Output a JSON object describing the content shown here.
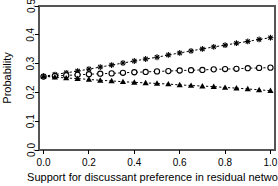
{
  "chart_data": {
    "type": "scatter",
    "title": "",
    "xlabel": "Support for discussant preference in residual network",
    "ylabel": "Probability",
    "xlim": [
      -0.02,
      1.02
    ],
    "ylim": [
      0.0,
      0.5
    ],
    "grid": false,
    "legend": "none",
    "xticks": [
      "0.0",
      "0.2",
      "0.4",
      "0.6",
      "0.8",
      "1.0"
    ],
    "xtick_values": [
      0.0,
      0.2,
      0.4,
      0.6,
      0.8,
      1.0
    ],
    "yticks": [
      "0.0",
      "0.1",
      "0.2",
      "0.3",
      "0.4",
      "0.5"
    ],
    "ytick_values": [
      0.0,
      0.1,
      0.2,
      0.3,
      0.4,
      0.5
    ],
    "x": [
      0.0,
      0.05,
      0.1,
      0.15,
      0.2,
      0.25,
      0.3,
      0.35,
      0.4,
      0.45,
      0.5,
      0.55,
      0.6,
      0.65,
      0.7,
      0.75,
      0.8,
      0.85,
      0.9,
      0.95,
      1.0
    ],
    "series": [
      {
        "name": "upper-series",
        "marker": "star",
        "linestyle": "dashed",
        "color": "#000000",
        "values": [
          0.256,
          0.262,
          0.268,
          0.274,
          0.281,
          0.288,
          0.295,
          0.302,
          0.309,
          0.316,
          0.322,
          0.33,
          0.337,
          0.344,
          0.351,
          0.358,
          0.364,
          0.371,
          0.377,
          0.384,
          0.39
        ]
      },
      {
        "name": "middle-series",
        "marker": "open-circle",
        "linestyle": "dashed",
        "color": "#000000",
        "values": [
          0.255,
          0.257,
          0.259,
          0.261,
          0.263,
          0.265,
          0.266,
          0.268,
          0.27,
          0.271,
          0.273,
          0.274,
          0.276,
          0.277,
          0.278,
          0.28,
          0.281,
          0.282,
          0.284,
          0.285,
          0.286
        ]
      },
      {
        "name": "lower-series",
        "marker": "filled-triangle",
        "linestyle": "dashed",
        "color": "#000000",
        "values": [
          0.256,
          0.253,
          0.25,
          0.248,
          0.245,
          0.242,
          0.24,
          0.237,
          0.235,
          0.233,
          0.231,
          0.229,
          0.226,
          0.224,
          0.222,
          0.22,
          0.217,
          0.215,
          0.212,
          0.209,
          0.206
        ]
      }
    ]
  }
}
